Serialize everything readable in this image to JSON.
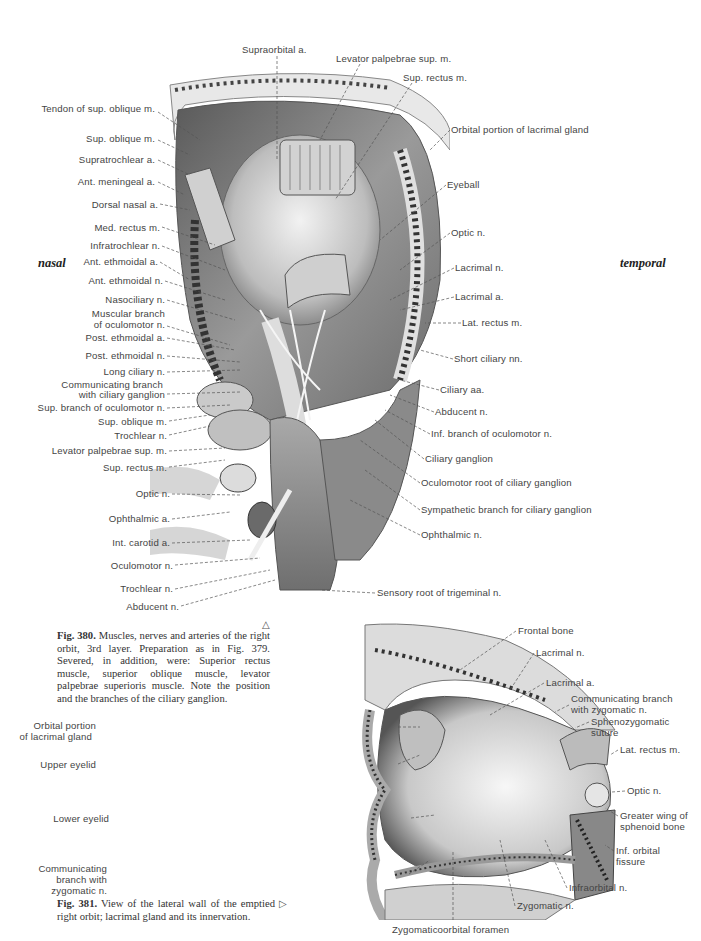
{
  "orientation": {
    "left": "nasal",
    "right": "temporal"
  },
  "figure_380": {
    "caption_number": "Fig. 380.",
    "caption_text": "Muscles, nerves and arteries of the right orbit, 3rd layer. Preparation as in Fig. 379. Severed, in addition, were: Superior rectus muscle, superior oblique muscle, levator palpebrae superioris muscle. Note the position and the branches of the ciliary ganglion.",
    "pointer_symbol": "△",
    "labels_top": [
      "Supraorbital a.",
      "Levator palpebrae sup. m.",
      "Sup. rectus m."
    ],
    "labels_left": [
      "Tendon of sup. oblique m.",
      "Sup. oblique m.",
      "Supratrochlear a.",
      "Ant. meningeal a.",
      "Dorsal nasal a.",
      "Med. rectus m.",
      "Infratrochlear n.",
      "Ant. ethmoidal a.",
      "Ant. ethmoidal n.",
      "Nasociliary n.",
      "Muscular branch",
      "of oculomotor n.",
      "Post. ethmoidal a.",
      "Post. ethmoidal n.",
      "Long ciliary n.",
      "Communicating branch",
      "with ciliary ganglion",
      "Sup. branch of oculomotor n.",
      "Sup. oblique m.",
      "Trochlear n.",
      "Levator palpebrae sup. m.",
      "Sup. rectus m.",
      "Optic n.",
      "Ophthalmic a.",
      "Int. carotid a.",
      "Oculomotor n.",
      "Trochlear n.",
      "Abducent n."
    ],
    "labels_right": [
      "Orbital portion of lacrimal gland",
      "Eyeball",
      "Optic n.",
      "Lacrimal n.",
      "Lacrimal a.",
      "Lat. rectus m.",
      "Short ciliary nn.",
      "Ciliary aa.",
      "Abducent n.",
      "Inf. branch of oculomotor n.",
      "Ciliary ganglion",
      "Oculomotor root of ciliary ganglion",
      "Sympathetic branch for ciliary ganglion",
      "Ophthalmic n.",
      "Sensory root of trigeminal n."
    ]
  },
  "figure_381": {
    "caption_number": "Fig. 381.",
    "caption_text": "View of the lateral wall of the emptied right orbit; lacrimal gland and its innervation.",
    "pointer_symbol": "▷",
    "labels_left": [
      "Orbital portion",
      "of lacrimal gland",
      "Upper eyelid",
      "Lower eyelid",
      "Communicating",
      "branch with",
      "zygomatic n."
    ],
    "labels_right": [
      "Frontal bone",
      "Lacrimal n.",
      "Lacrimal a.",
      "Communicating branch",
      "with zygomatic n.",
      "Sphenozygomatic",
      "suture",
      "Lat. rectus m.",
      "Optic n.",
      "Greater wing of",
      "sphenoid bone",
      "Inf. orbital",
      "fissure",
      "Infraorbital n.",
      "Zygomatic n."
    ],
    "labels_bottom": [
      "Zygomaticoorbital foramen"
    ]
  }
}
